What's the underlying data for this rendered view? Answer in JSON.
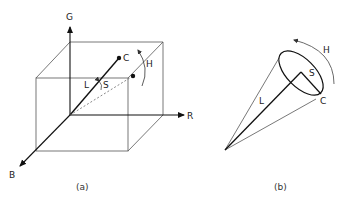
{
  "figure_a": {
    "caption": "(a)",
    "axes": {
      "g": "G",
      "r": "R",
      "b": "B"
    },
    "labels": {
      "c": "C",
      "h": "H",
      "l": "L",
      "s": "S"
    }
  },
  "figure_b": {
    "caption": "(b)",
    "labels": {
      "c": "C",
      "h": "H",
      "l": "L",
      "s": "S"
    }
  },
  "colors": {
    "line": "#1a1a1a",
    "thin": "#555555",
    "background": "#ffffff"
  }
}
